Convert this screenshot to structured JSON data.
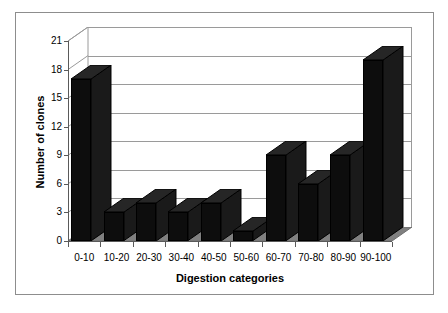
{
  "chart_data": {
    "type": "bar",
    "title": "",
    "xlabel": "Digestion categories",
    "ylabel": "Number of clones",
    "categories": [
      "0-10",
      "10-20",
      "20-30",
      "30-40",
      "40-50",
      "50-60",
      "60-70",
      "70-80",
      "80-90",
      "90-100"
    ],
    "values": [
      17,
      3,
      4,
      3,
      4,
      1,
      9,
      6,
      9,
      19
    ],
    "ylim": [
      0,
      21
    ],
    "yticks": [
      0,
      3,
      6,
      9,
      12,
      15,
      18,
      21
    ],
    "ytick_labels": [
      "0",
      "3",
      "6",
      "9",
      "12",
      "15",
      "18",
      "21"
    ],
    "grid": true,
    "legend": false,
    "legend_position": "none",
    "style": "3d-column",
    "series": [
      {
        "name": "Number of clones",
        "values": [
          17,
          3,
          4,
          3,
          4,
          1,
          9,
          6,
          9,
          19
        ],
        "color": "#0d0d0d"
      }
    ]
  },
  "colors": {
    "bar_front": "#0d0d0d",
    "bar_side": "#1a1a1a",
    "bar_top": "#262626",
    "floor": "#808080",
    "gridline": "#9a9a9a",
    "axis": "#5a5a5a",
    "frame": "#8d8d8d",
    "background": "#ffffff"
  }
}
